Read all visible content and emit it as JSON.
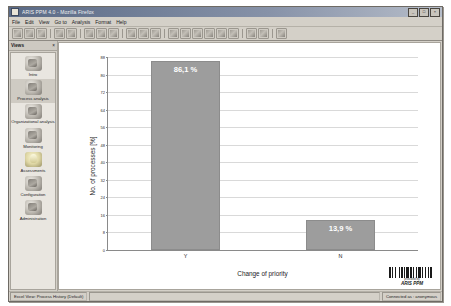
{
  "window": {
    "title": "ARIS PPM 4.0 - Mozilla Firefox",
    "icon": "app-icon",
    "buttons": {
      "minimize": "_",
      "maximize": "□",
      "close": "×"
    }
  },
  "menu": {
    "items": [
      {
        "label": "File"
      },
      {
        "label": "Edit"
      },
      {
        "label": "View"
      },
      {
        "label": "Go to"
      },
      {
        "label": "Analysis"
      },
      {
        "label": "Format"
      },
      {
        "label": "Help"
      }
    ]
  },
  "toolbar": {
    "icons": [
      "cursor-icon",
      "back-icon",
      "forward-icon",
      "refresh-icon",
      "stop-icon",
      "home-icon",
      "print-icon",
      "save-icon",
      "copy-icon",
      "chart-bar-icon",
      "chart-pie-icon",
      "chart-line-icon",
      "table-icon",
      "grid-icon",
      "filter-icon",
      "person-icon",
      "sort-icon",
      "export-icon",
      "zoom-in-icon",
      "zoom-out-icon",
      "help-icon"
    ]
  },
  "sidebar": {
    "header": {
      "title": "Views",
      "close": "×"
    },
    "items": [
      {
        "label": "Intro",
        "icon": "house-icon",
        "selected": false
      },
      {
        "label": "Process analysis",
        "icon": "process-icon",
        "selected": true
      },
      {
        "label": "Organizational analysis",
        "icon": "org-icon",
        "selected": false
      },
      {
        "label": "Monitoring",
        "icon": "monitor-icon",
        "selected": false
      },
      {
        "label": "Assessments",
        "icon": "bulb-icon",
        "selected": false
      },
      {
        "label": "Configuration",
        "icon": "config-icon",
        "selected": false
      },
      {
        "label": "Administration",
        "icon": "admin-icon",
        "selected": false
      }
    ]
  },
  "chart_data": {
    "type": "bar",
    "title": "",
    "categories": [
      "Y",
      "N"
    ],
    "values": [
      86.1,
      13.9
    ],
    "data_labels": [
      "86,1 %",
      "13,9 %"
    ],
    "xlabel": "Change of priority",
    "ylabel": "No. of processes [%]",
    "ylim": [
      0,
      88
    ],
    "yticks": [
      0,
      8,
      16,
      24,
      32,
      40,
      48,
      56,
      64,
      72,
      80,
      88
    ],
    "ytick_labels": [
      "0",
      "8",
      "16",
      "24",
      "32",
      "40",
      "48",
      "56",
      "64",
      "72",
      "80",
      "88"
    ],
    "grid": true,
    "legend": false,
    "bar_color": "#9d9d9d",
    "label_color": "#ffffff"
  },
  "badge": {
    "barcode": "barcode-icon",
    "subtitle": "provided by",
    "brand": "ARIS PPM"
  },
  "statusbar": {
    "left": "Excel View: Process History (Default)",
    "middle": "",
    "right": "Connected as : anonymous"
  }
}
